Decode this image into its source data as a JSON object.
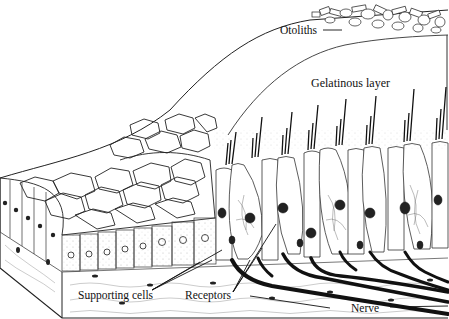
{
  "figure": {
    "background": "#ffffff",
    "ink": "#111111",
    "labels": {
      "otoliths": "Otoliths",
      "gelatinous_layer": "Gelatinous layer",
      "supporting_cells": "Supporting cells",
      "receptors": "Receptors",
      "nerve": "Nerve"
    }
  }
}
